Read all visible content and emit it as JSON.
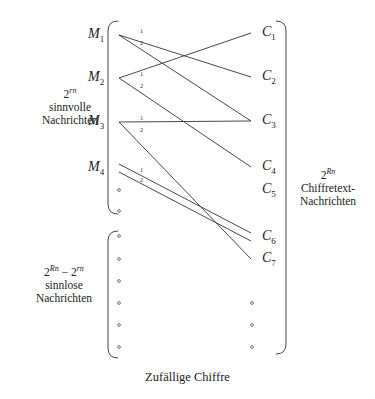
{
  "diagram": {
    "title": "Zufällige Chiffre",
    "left_nodes": [
      {
        "id": "M1",
        "base": "M",
        "sub": "1",
        "y": 35
      },
      {
        "id": "M2",
        "base": "M",
        "sub": "2",
        "y": 78
      },
      {
        "id": "M3",
        "base": "M",
        "sub": "3",
        "y": 122
      },
      {
        "id": "M4",
        "base": "M",
        "sub": "4",
        "y": 168
      }
    ],
    "right_nodes": [
      {
        "id": "C1",
        "base": "C",
        "sub": "1",
        "y": 33
      },
      {
        "id": "C2",
        "base": "C",
        "sub": "2",
        "y": 77
      },
      {
        "id": "C3",
        "base": "C",
        "sub": "3",
        "y": 121
      },
      {
        "id": "C4",
        "base": "C",
        "sub": "4",
        "y": 167
      },
      {
        "id": "C5",
        "base": "C",
        "sub": "5",
        "y": 190
      },
      {
        "id": "C6",
        "base": "C",
        "sub": "6",
        "y": 237
      },
      {
        "id": "C7",
        "base": "C",
        "sub": "7",
        "y": 259
      }
    ],
    "edges": [
      {
        "from": "M1",
        "to": "C2",
        "key": "1"
      },
      {
        "from": "M1",
        "to": "C3",
        "key": "2"
      },
      {
        "from": "M2",
        "to": "C1",
        "key": "1"
      },
      {
        "from": "M2",
        "to": "C4",
        "key": "2"
      },
      {
        "from": "M3",
        "to": "C3",
        "key": "1"
      },
      {
        "from": "M3",
        "to": "C7",
        "key": "2"
      },
      {
        "from": "M4",
        "to": "C6",
        "key": "1"
      },
      {
        "from": "M4",
        "to": "C6",
        "key": "2"
      }
    ],
    "left_dots_y": [
      190,
      211,
      236,
      259,
      281,
      303,
      325,
      347
    ],
    "right_dots_y": [
      303,
      325,
      347
    ],
    "groups": {
      "meaningful": {
        "power": "2",
        "exp": "rn",
        "line1": "sinnvolle",
        "line2": "Nachrichten"
      },
      "meaningless": {
        "power_a": "2",
        "exp_a": "Rn",
        "minus": " − ",
        "power_b": "2",
        "exp_b": "rn",
        "line1": "sinnlose",
        "line2": "Nachrichten"
      },
      "ciphertexts": {
        "power": "2",
        "exp": "Rn",
        "line1": "Chiffretext-",
        "line2": "Nachrichten"
      }
    }
  }
}
